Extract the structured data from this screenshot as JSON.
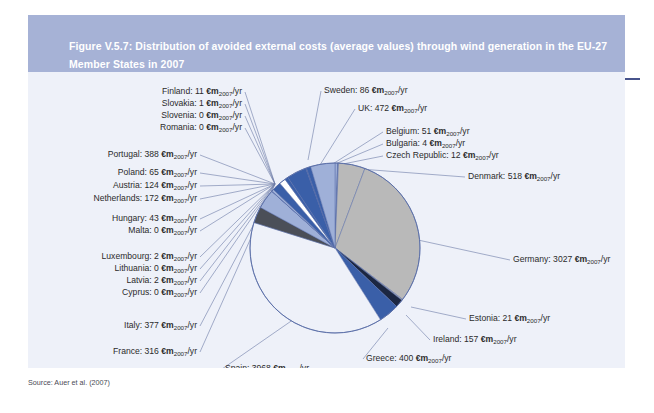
{
  "figure": {
    "title": "Figure V.5.7: Distribution of avoided external costs (average values) through wind generation in the EU-27 Member States in 2007",
    "source_note": "Source: Auer et al. (2007)",
    "unit_label": "€m",
    "unit_subscript": "2007",
    "unit_suffix": "/yr",
    "header_bg": "#a6b2d6",
    "header_rule": "#47538c",
    "canvas_bg": "#eef1f9",
    "leader_line_color": "#6b7ba6",
    "pie_outline": "#5b6fa8"
  },
  "chart_data": {
    "type": "pie",
    "title": "Distribution of avoided external costs (average values) through wind generation in the EU-27 Member States in 2007",
    "unit": "€m2007/yr",
    "legend": "none (direct callout labels)",
    "total": 10463,
    "start_angle_deg": -90,
    "direction": "clockwise",
    "categories": [
      "Belgium",
      "Bulgaria",
      "Czech Republic",
      "Denmark",
      "Germany",
      "Estonia",
      "Ireland",
      "Greece",
      "Spain",
      "France",
      "Italy",
      "Cyprus",
      "Latvia",
      "Lithuania",
      "Luxembourg",
      "Hungary",
      "Malta",
      "Netherlands",
      "Austria",
      "Poland",
      "Portugal",
      "Romania",
      "Slovenia",
      "Slovakia",
      "Finland",
      "Sweden",
      "UK"
    ],
    "values": [
      51,
      4,
      12,
      518,
      3027,
      21,
      157,
      400,
      3968,
      316,
      377,
      0,
      2,
      0,
      2,
      43,
      0,
      172,
      124,
      65,
      388,
      0,
      0,
      1,
      11,
      86,
      472
    ],
    "colors": [
      "#9fb0d8",
      "#0f1b3d",
      "#9fb0d8",
      "#b9b9b9",
      "#b9b9b9",
      "#b9b9b9",
      "#1c2742",
      "#3a5fa8",
      "#eef1f9",
      "#4b4f58",
      "#9fb0d8",
      "#3a5fa8",
      "#9fb0d8",
      "#b9b9b9",
      "#3a5fa8",
      "#9fb0d8",
      "#b9b9b9",
      "#3a5fa8",
      "#ffffff",
      "#3a5fa8",
      "#3a5fa8",
      "#9fb0d8",
      "#b9b9b9",
      "#ffffff",
      "#3a5fa8",
      "#3a5fa8",
      "#9fb0d8"
    ]
  },
  "labels": [
    {
      "name": "finland",
      "text": "Finland: 11 ",
      "side": "left",
      "x": 214,
      "y": 14,
      "anchor_x": 247,
      "anchor_y": 112
    },
    {
      "name": "slovakia",
      "text": "Slovakia: 1 ",
      "side": "left",
      "x": 214,
      "y": 26,
      "anchor_x": 247,
      "anchor_y": 112
    },
    {
      "name": "slovenia",
      "text": "Slovenia: 0 ",
      "side": "left",
      "x": 214,
      "y": 38,
      "anchor_x": 247,
      "anchor_y": 112
    },
    {
      "name": "romania",
      "text": "Romania: 0 ",
      "side": "left",
      "x": 214,
      "y": 50,
      "anchor_x": 247,
      "anchor_y": 112
    },
    {
      "name": "portugal",
      "text": "Portugal: 388 ",
      "side": "left",
      "x": 169,
      "y": 77,
      "anchor_x": 247,
      "anchor_y": 112
    },
    {
      "name": "poland",
      "text": "Poland: 65 ",
      "side": "left",
      "x": 169,
      "y": 95,
      "anchor_x": 247,
      "anchor_y": 112
    },
    {
      "name": "austria",
      "text": "Austria: 124 ",
      "side": "left",
      "x": 169,
      "y": 108,
      "anchor_x": 247,
      "anchor_y": 112
    },
    {
      "name": "netherlands",
      "text": "Netherlands: 172 ",
      "side": "left",
      "x": 169,
      "y": 121,
      "anchor_x": 247,
      "anchor_y": 112
    },
    {
      "name": "hungary",
      "text": "Hungary: 43 ",
      "side": "left",
      "x": 169,
      "y": 141,
      "anchor_x": 247,
      "anchor_y": 112
    },
    {
      "name": "malta",
      "text": "Malta: 0 ",
      "side": "left",
      "x": 169,
      "y": 153,
      "anchor_x": 247,
      "anchor_y": 112
    },
    {
      "name": "luxembourg",
      "text": "Luxembourg: 2 ",
      "side": "left",
      "x": 169,
      "y": 179,
      "anchor_x": 247,
      "anchor_y": 112
    },
    {
      "name": "lithuania",
      "text": "Lithuania: 0 ",
      "side": "left",
      "x": 169,
      "y": 191,
      "anchor_x": 247,
      "anchor_y": 112
    },
    {
      "name": "latvia",
      "text": "Latvia: 2 ",
      "side": "left",
      "x": 169,
      "y": 203,
      "anchor_x": 247,
      "anchor_y": 112
    },
    {
      "name": "cyprus",
      "text": "Cyprus: 0 ",
      "side": "left",
      "x": 169,
      "y": 215,
      "anchor_x": 247,
      "anchor_y": 112
    },
    {
      "name": "italy",
      "text": "Italy: 377 ",
      "side": "left",
      "x": 169,
      "y": 248,
      "anchor_x": 247,
      "anchor_y": 112
    },
    {
      "name": "france",
      "text": "France: 316 ",
      "side": "left",
      "x": 169,
      "y": 274,
      "anchor_x": 247,
      "anchor_y": 112
    },
    {
      "name": "spain",
      "text": "Spain: 3968 ",
      "side": "right",
      "x": 197,
      "y": 291,
      "anchor_x": 269,
      "anchor_y": 245
    },
    {
      "name": "sweden",
      "text": "Sweden: 86 ",
      "side": "right",
      "x": 296,
      "y": 13,
      "anchor_x": 280,
      "anchor_y": 88
    },
    {
      "name": "uk",
      "text": "UK: 472 ",
      "side": "right",
      "x": 330,
      "y": 31,
      "anchor_x": 292,
      "anchor_y": 93
    },
    {
      "name": "belgium",
      "text": "Belgium: 51 ",
      "side": "right",
      "x": 358,
      "y": 54,
      "anchor_x": 300,
      "anchor_y": 95
    },
    {
      "name": "bulgaria",
      "text": "Bulgaria: 4 ",
      "side": "right",
      "x": 358,
      "y": 66,
      "anchor_x": 300,
      "anchor_y": 95
    },
    {
      "name": "czech-republic",
      "text": "Czech Republic: 12 ",
      "side": "right",
      "x": 358,
      "y": 78,
      "anchor_x": 300,
      "anchor_y": 95
    },
    {
      "name": "denmark",
      "text": "Denmark: 518 ",
      "side": "right",
      "x": 440,
      "y": 99,
      "anchor_x": 332,
      "anchor_y": 97
    },
    {
      "name": "germany",
      "text": "Germany: 3027 ",
      "side": "right",
      "x": 485,
      "y": 182,
      "anchor_x": 390,
      "anchor_y": 168
    },
    {
      "name": "estonia",
      "text": "Estonia: 21 ",
      "side": "right",
      "x": 441,
      "y": 241,
      "anchor_x": 383,
      "anchor_y": 235
    },
    {
      "name": "ireland",
      "text": "Ireland: 157 ",
      "side": "right",
      "x": 405,
      "y": 262,
      "anchor_x": 378,
      "anchor_y": 243
    },
    {
      "name": "greece",
      "text": "Greece: 400 ",
      "side": "right",
      "x": 338,
      "y": 281,
      "anchor_x": 360,
      "anchor_y": 256
    }
  ]
}
